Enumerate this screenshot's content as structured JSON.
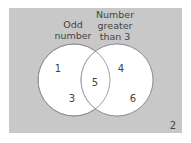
{
  "colors": {
    "background": "#ffffff",
    "panel": "#c8c8c8",
    "circle_fill": "#ffffff",
    "circle_stroke": "#8a8a8a",
    "text": "#444444"
  },
  "venn": {
    "sets": [
      {
        "label_lines": [
          "Odd",
          "number"
        ],
        "only_members": [
          "1",
          "3"
        ]
      },
      {
        "label_lines": [
          "Number",
          "greater",
          "than 3"
        ],
        "only_members": [
          "4",
          "6"
        ]
      }
    ],
    "intersection": [
      "5"
    ],
    "outside": [
      "2"
    ]
  }
}
